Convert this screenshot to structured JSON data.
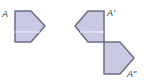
{
  "diagram": {
    "colors": {
      "fill": "#c9c9e2",
      "stroke": "#6c6c86",
      "background": "#ffffff",
      "label": "#333333"
    },
    "shapes": [
      {
        "id": "A",
        "label": "A",
        "points": "15,11 31,11 45,26 31,42 15,42"
      },
      {
        "id": "A_prime",
        "label": "A'",
        "points": "104,11 88,11 75,26 88,42 104,42"
      },
      {
        "id": "A_double_prime",
        "label": "A\"",
        "points": "104,42 120,42 134,58 120,74 104,74"
      }
    ]
  }
}
